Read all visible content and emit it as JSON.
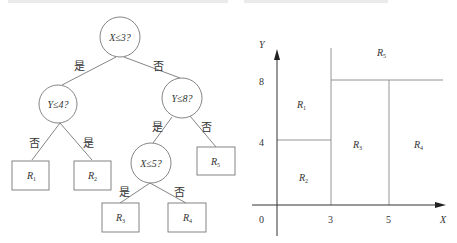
{
  "tree": {
    "nodes": {
      "root": {
        "label": "X≤3?"
      },
      "left": {
        "label": "Y≤4?"
      },
      "right": {
        "label": "Y≤8?"
      },
      "rightLeft": {
        "label": "X≤5?"
      }
    },
    "edges": {
      "root_left": "是",
      "root_right": "否",
      "left_r1": "否",
      "left_r2": "是",
      "right_x5": "是",
      "right_r5": "否",
      "x5_r3": "是",
      "x5_r4": "否"
    },
    "leaves": {
      "r1": {
        "main": "R",
        "sub": "1"
      },
      "r2": {
        "main": "R",
        "sub": "2"
      },
      "r3": {
        "main": "R",
        "sub": "3"
      },
      "r4": {
        "main": "R",
        "sub": "4"
      },
      "r5": {
        "main": "R",
        "sub": "5"
      }
    }
  },
  "partition": {
    "axis": {
      "x_label": "X",
      "y_label": "Y",
      "origin": "0"
    },
    "x_ticks": [
      "3",
      "5"
    ],
    "y_ticks": [
      "8",
      "4"
    ],
    "regions": {
      "r1": {
        "main": "R",
        "sub": "1"
      },
      "r2": {
        "main": "R",
        "sub": "2"
      },
      "r3": {
        "main": "R",
        "sub": "3"
      },
      "r4": {
        "main": "R",
        "sub": "4"
      },
      "r5": {
        "main": "R",
        "sub": "5"
      }
    }
  }
}
